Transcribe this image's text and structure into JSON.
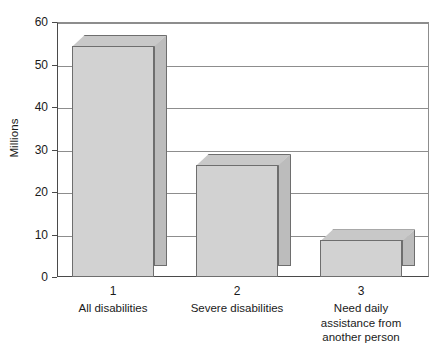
{
  "chart_data": {
    "type": "bar",
    "title": "",
    "subtitle": "",
    "xlabel": "",
    "ylabel": "Millions",
    "ylim": [
      0,
      60
    ],
    "ytick_labels": [
      "60",
      "50",
      "40",
      "30",
      "20",
      "10",
      "0"
    ],
    "ytick_values": [
      60,
      50,
      40,
      30,
      20,
      10,
      0
    ],
    "grid": true,
    "legend": false,
    "legend_position": "none",
    "style": "3d-bar",
    "xtick_numbers": [
      "1",
      "2",
      "3"
    ],
    "categories": [
      "All disabilities",
      "Severe disabilities",
      "Need daily\nassistance from\nanother person"
    ],
    "values": [
      54.4,
      26.4,
      8.6
    ],
    "series": [
      {
        "name": "Millions",
        "values": [
          54.4,
          26.4,
          8.6
        ]
      }
    ]
  },
  "colors": {
    "bar_front": "#d2d2d2",
    "bar_side": "#bcbcbc",
    "bar_top": "#c8c8c8",
    "bar_outline": "#6e6e6e",
    "axis": "#4a4a4a",
    "gridline": "#8d8d8d",
    "background": "#ffffff",
    "text": "#1a1a1a"
  },
  "axis": {
    "y_title": "Millions"
  }
}
